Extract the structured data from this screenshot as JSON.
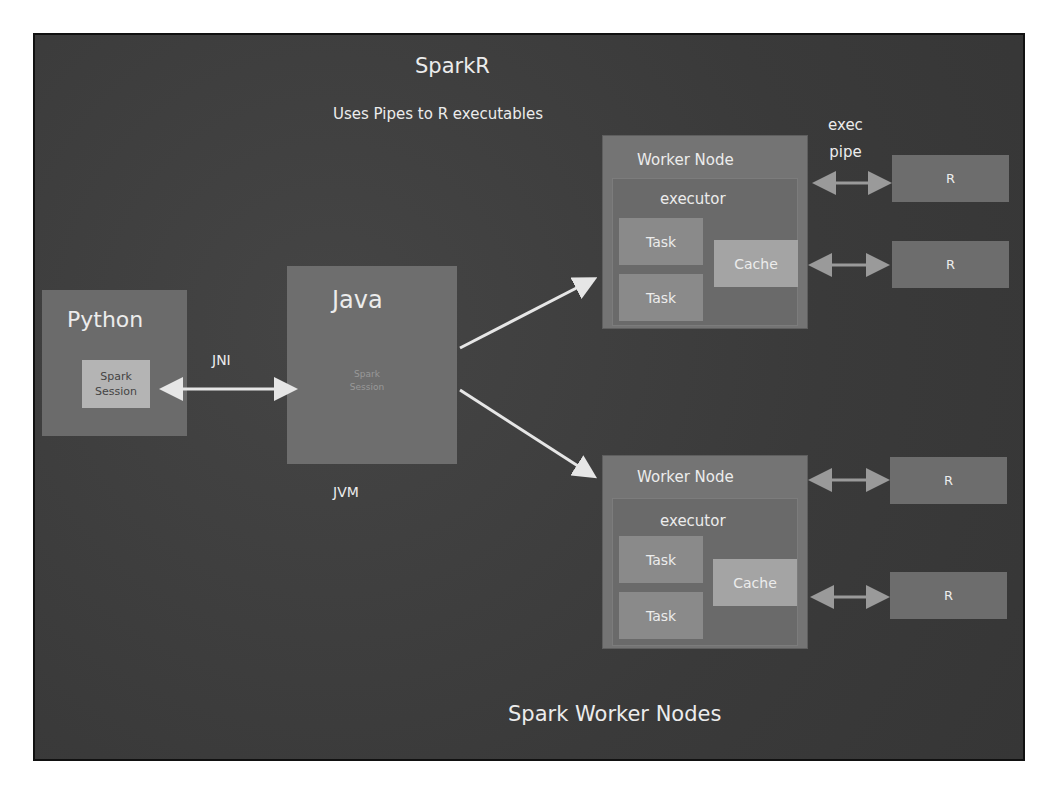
{
  "title": "SparkR",
  "subtitle": "Uses Pipes to R executables",
  "footer": "Spark Worker Nodes",
  "python": {
    "label": "Python",
    "session": [
      "Spark",
      "Session"
    ]
  },
  "jni": {
    "label": "JNI"
  },
  "java": {
    "label": "Java",
    "session": [
      "Spark",
      "Session"
    ]
  },
  "jvm": {
    "label": "JVM"
  },
  "exec_pipe": [
    "exec",
    "pipe"
  ],
  "workers": [
    {
      "label": "Worker Node",
      "executor": "executor",
      "tasks": [
        "Task",
        "Task"
      ],
      "cache": "Cache",
      "r_processes": [
        "R",
        "R"
      ]
    },
    {
      "label": "Worker Node",
      "executor": "executor",
      "tasks": [
        "Task",
        "Task"
      ],
      "cache": "Cache",
      "r_processes": [
        "R",
        "R"
      ]
    }
  ],
  "colors": {
    "background": "#3d3d3d",
    "chalk": "#ececec",
    "box": "#6e6e6e",
    "cache": "#a4a4a4"
  }
}
